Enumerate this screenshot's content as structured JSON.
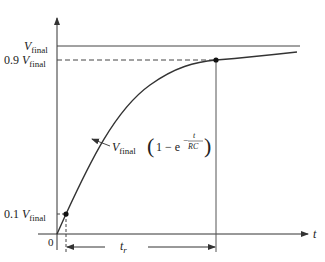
{
  "diagram": {
    "type": "rc-charging-rise-time",
    "axes": {
      "x_label": "t",
      "origin_label": "0"
    },
    "levels": {
      "final": {
        "V": "V",
        "sub": "final",
        "prefix": ""
      },
      "ninety": {
        "prefix": "0.9 ",
        "V": "V",
        "sub": "final"
      },
      "ten": {
        "prefix": "0.1 ",
        "V": "V",
        "sub": "final"
      }
    },
    "curve_equation": {
      "V": "V",
      "sub": "final",
      "open": "(",
      "body": "1 − e",
      "exp_sign": "−",
      "exp_num": "t",
      "exp_den": "RC",
      "close": ")"
    },
    "rise_time": {
      "t": "t",
      "sub": "r"
    },
    "colors": {
      "line": "#333333",
      "curve": "#333333",
      "point": "#111111",
      "text": "#222222"
    }
  }
}
